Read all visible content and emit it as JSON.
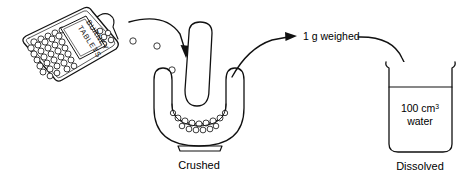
{
  "figure": {
    "background_color": "#ffffff",
    "ink_color": "#111111"
  },
  "stages": {
    "source": {
      "name": "tablet-bottle",
      "label_line1": "BURNEY",
      "label_line2": "TABLETS",
      "contents": "tablets"
    },
    "grinding": {
      "name": "mortar-and-pestle",
      "caption": "Crushed"
    },
    "dissolving": {
      "name": "beaker",
      "volume_value": "100 cm",
      "volume_exponent": "3",
      "contents_label": "water",
      "caption": "Dissolved"
    }
  },
  "flow": {
    "arrow_1_name": "arrow-bottle-to-mortar",
    "transfer_label": "1 g weighed",
    "arrow_2_name": "arrow-mortar-to-beaker"
  },
  "falling_tablets": {
    "count": 3
  }
}
